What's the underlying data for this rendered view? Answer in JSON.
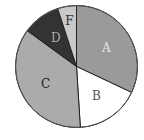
{
  "chart_data": {
    "type": "pie",
    "title": "",
    "categories": [
      "A",
      "B",
      "C",
      "D",
      "F"
    ],
    "values": [
      32,
      17,
      36,
      10,
      5
    ],
    "unit": "percent (estimated)",
    "start_angle_deg": 0,
    "direction": "clockwise",
    "legend": "none (labels inside slices)",
    "colors": {
      "A": "#9a9a9a",
      "B": "#ffffff",
      "C": "#ababab",
      "D": "#333333",
      "F": "#c9c9c9"
    },
    "label_colors": {
      "A": "#e8e8e8",
      "B": "#555555",
      "C": "#222222",
      "D": "#aaaaaa",
      "F": "#333333"
    }
  }
}
